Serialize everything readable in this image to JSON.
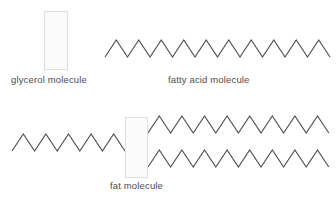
{
  "diagram": {
    "background_color": "#ffffff",
    "line_color": "#4a4a4a",
    "box_fill_color": "#fbfbfb",
    "box_border_color": "#dedede",
    "text_color": "#4d4d4d"
  },
  "labels": {
    "glycerol": "glycerol molecule",
    "fatty_acid": "fatty acid molecule",
    "fat": "fat molecule"
  },
  "shapes": {
    "glycerol_box_top": {
      "x": 44,
      "y": 11,
      "width": 24,
      "height": 59
    },
    "glycerol_box_fat": {
      "x": 125,
      "y": 117,
      "width": 23,
      "height": 61
    }
  },
  "chains": {
    "fatty_acid_top": {
      "name": "fatty-acid-chain",
      "start_x": 105,
      "top_y": 40,
      "bottom_y": 57,
      "segment_width": 11.25,
      "segments": 20,
      "start_at_bottom": true
    },
    "fat_left": {
      "name": "fat-left-chain",
      "start_x": 12,
      "top_y": 134,
      "bottom_y": 151,
      "segment_width": 11.3,
      "segments": 10,
      "start_at_bottom": true
    },
    "fat_upper_right": {
      "name": "fat-upper-right-chain",
      "start_x": 148,
      "top_y": 116,
      "bottom_y": 133,
      "segment_width": 11.3,
      "segments": 16,
      "start_at_bottom": true
    },
    "fat_lower_right": {
      "name": "fat-lower-right-chain",
      "start_x": 148,
      "top_y": 150,
      "bottom_y": 167,
      "segment_width": 11.3,
      "segments": 16,
      "start_at_bottom": true
    }
  }
}
